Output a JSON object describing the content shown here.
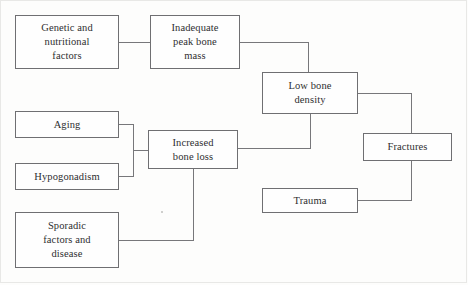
{
  "diagram": {
    "colors": {
      "background": "#fdfdfc",
      "box_border": "#6f6f72",
      "box_fill": "#fefefe",
      "connector": "#77777a",
      "text": "#2e2e30",
      "frame": "#e8e8e6"
    },
    "nodes": [
      {
        "id": "genetic-nutritional-factors",
        "label": "Genetic and\nnutritional\nfactors",
        "x": 15,
        "y": 15,
        "w": 104,
        "h": 54
      },
      {
        "id": "inadequate-peak-bone-mass",
        "label": "Inadequate\npeak bone\nmass",
        "x": 150,
        "y": 15,
        "w": 90,
        "h": 54
      },
      {
        "id": "low-bone-density",
        "label": "Low bone\ndensity",
        "x": 262,
        "y": 72,
        "w": 96,
        "h": 42
      },
      {
        "id": "aging",
        "label": "Aging",
        "x": 15,
        "y": 111,
        "w": 104,
        "h": 27
      },
      {
        "id": "hypogonadism",
        "label": "Hypogonadism",
        "x": 15,
        "y": 163,
        "w": 104,
        "h": 27
      },
      {
        "id": "increased-bone-loss",
        "label": "Increased\nbone loss",
        "x": 148,
        "y": 130,
        "w": 90,
        "h": 39
      },
      {
        "id": "fractures",
        "label": "Fractures",
        "x": 363,
        "y": 133,
        "w": 89,
        "h": 28
      },
      {
        "id": "trauma",
        "label": "Trauma",
        "x": 262,
        "y": 188,
        "w": 96,
        "h": 25
      },
      {
        "id": "sporadic-factors-and-disease",
        "label": "Sporadic\nfactors and\ndisease",
        "x": 15,
        "y": 212,
        "w": 104,
        "h": 56
      }
    ],
    "edges": [
      {
        "id": "edge-genetic-to-inadequate",
        "from": "genetic-nutritional-factors",
        "to": "inadequate-peak-bone-mass",
        "points": "119,42 150,42"
      },
      {
        "id": "edge-inadequate-to-lowbone",
        "from": "inadequate-peak-bone-mass",
        "to": "low-bone-density",
        "points": "240,42 308,42 308,72"
      },
      {
        "id": "edge-aging-to-junction",
        "from": "aging",
        "to": "increased-bone-loss",
        "points": "119,124 133,124 133,150 148,150"
      },
      {
        "id": "edge-hypogonadism-to-junction",
        "from": "hypogonadism",
        "to": "increased-bone-loss",
        "points": "119,176 133,176 133,150"
      },
      {
        "id": "edge-increasedloss-to-lowbone",
        "from": "increased-bone-loss",
        "to": "low-bone-density",
        "points": "238,148 310,148 310,114"
      },
      {
        "id": "edge-sporadic-to-increasedloss",
        "from": "sporadic-factors-and-disease",
        "to": "increased-bone-loss",
        "points": "119,240 193,240 193,169"
      },
      {
        "id": "edge-lowbone-to-fractures",
        "from": "low-bone-density",
        "to": "fractures",
        "points": "358,93 411,93 411,133"
      },
      {
        "id": "edge-trauma-to-fractures",
        "from": "trauma",
        "to": "fractures",
        "points": "358,200 411,200 411,161"
      }
    ]
  }
}
